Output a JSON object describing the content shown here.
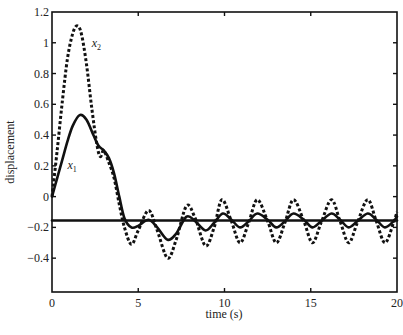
{
  "chart_data": {
    "type": "line",
    "title": "",
    "xlabel": "time (s)",
    "ylabel": "displacement",
    "xlim": [
      0,
      20
    ],
    "ylim": [
      -0.62,
      1.2
    ],
    "xticks": [
      0,
      5,
      10,
      15,
      20
    ],
    "xtick_labels": [
      "0",
      "5",
      "10",
      "15",
      "20"
    ],
    "yticks": [
      1.2,
      1,
      0.8,
      0.6,
      0.4,
      0.2,
      0,
      -0.2,
      -0.4
    ],
    "ytick_labels": [
      "1.2",
      "1",
      "0.8",
      "0.6",
      "0.4",
      "0.2",
      "0",
      "−0.2",
      "−0.4"
    ],
    "grid": false,
    "legend": "none (inline labels)",
    "series": [
      {
        "name": "x1",
        "label_main": "x",
        "label_sub": "1",
        "style": "solid",
        "color": "#111111",
        "label_pos": [
          0.9,
          0.18
        ],
        "x": [
          0,
          0.3,
          0.6,
          0.9,
          1.2,
          1.6,
          2.0,
          2.4,
          2.7,
          3.0,
          3.3,
          3.6,
          3.9,
          4.2,
          4.6,
          5.0,
          5.6,
          6.1,
          6.7,
          7.2,
          7.8,
          8.3,
          8.9,
          9.4,
          9.9,
          10.4,
          10.9,
          11.4,
          11.9,
          12.5,
          13.0,
          13.5,
          14.0,
          14.6,
          15.1,
          15.6,
          16.2,
          16.7,
          17.2,
          17.7,
          18.3,
          18.8,
          19.3,
          19.8,
          20.0
        ],
        "y": [
          0.0,
          0.12,
          0.24,
          0.36,
          0.46,
          0.53,
          0.5,
          0.4,
          0.33,
          0.3,
          0.25,
          0.15,
          0.0,
          -0.14,
          -0.2,
          -0.19,
          -0.15,
          -0.2,
          -0.28,
          -0.24,
          -0.13,
          -0.16,
          -0.22,
          -0.17,
          -0.11,
          -0.15,
          -0.2,
          -0.16,
          -0.11,
          -0.15,
          -0.2,
          -0.16,
          -0.11,
          -0.15,
          -0.2,
          -0.16,
          -0.11,
          -0.15,
          -0.2,
          -0.16,
          -0.11,
          -0.15,
          -0.2,
          -0.16,
          -0.13
        ]
      },
      {
        "name": "x2",
        "label_main": "x",
        "label_sub": "2",
        "style": "dashed",
        "color": "#111111",
        "label_pos": [
          2.3,
          0.97
        ],
        "x": [
          0,
          0.3,
          0.6,
          0.9,
          1.2,
          1.45,
          1.7,
          2.0,
          2.3,
          2.6,
          2.8,
          3.0,
          3.3,
          3.6,
          3.9,
          4.2,
          4.6,
          5.0,
          5.6,
          6.1,
          6.7,
          7.2,
          7.8,
          8.3,
          8.9,
          9.4,
          9.85,
          10.4,
          10.9,
          11.4,
          11.9,
          12.5,
          13.0,
          13.5,
          14.0,
          14.6,
          15.1,
          15.6,
          16.2,
          16.7,
          17.2,
          17.7,
          18.3,
          18.8,
          19.3,
          19.8,
          20.0
        ],
        "y": [
          0.0,
          0.3,
          0.62,
          0.9,
          1.06,
          1.11,
          1.06,
          0.86,
          0.58,
          0.34,
          0.26,
          0.3,
          0.22,
          0.12,
          -0.05,
          -0.2,
          -0.31,
          -0.22,
          -0.09,
          -0.22,
          -0.4,
          -0.28,
          -0.06,
          -0.14,
          -0.32,
          -0.2,
          -0.02,
          -0.16,
          -0.3,
          -0.17,
          -0.02,
          -0.16,
          -0.3,
          -0.17,
          -0.02,
          -0.16,
          -0.3,
          -0.17,
          -0.02,
          -0.16,
          -0.3,
          -0.17,
          -0.02,
          -0.16,
          -0.3,
          -0.17,
          -0.1
        ]
      },
      {
        "name": "reference",
        "style": "solid",
        "color": "#111111",
        "x": [
          0,
          20
        ],
        "y": [
          -0.155,
          -0.155
        ]
      }
    ]
  },
  "layout": {
    "plot_left_px": 52,
    "plot_right_px": 397,
    "plot_top_px": 12,
    "plot_bottom_px": 292
  }
}
